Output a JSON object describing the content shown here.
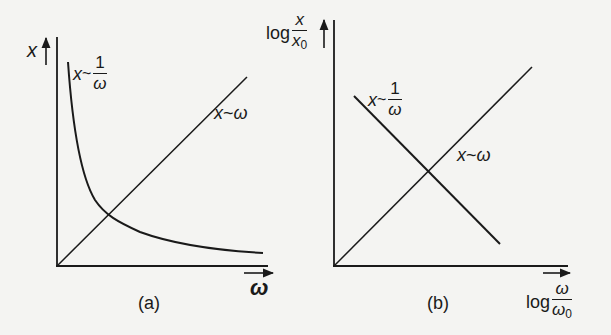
{
  "figure": {
    "panel_a": {
      "caption": "(a)",
      "y_axis_label": "x",
      "x_axis_label": "ω",
      "curve_inverse": {
        "lhs": "x",
        "rel": "~",
        "num": "1",
        "den": "ω"
      },
      "curve_linear": {
        "lhs": "x",
        "rel": "~",
        "rhs": "ω"
      },
      "scale": "linear"
    },
    "panel_b": {
      "caption": "(b)",
      "y_axis_label": {
        "prefix": "log",
        "num": "x",
        "den": "x",
        "den_sub": "0"
      },
      "x_axis_label": {
        "prefix": "log",
        "num": "ω",
        "den": "ω",
        "den_sub": "0"
      },
      "curve_inverse": {
        "lhs": "x",
        "rel": "~",
        "num": "1",
        "den": "ω"
      },
      "curve_linear": {
        "lhs": "x",
        "rel": "~",
        "rhs": "ω"
      },
      "scale": "log-log"
    },
    "colors": {
      "ink": "#1a1a1a",
      "paper": "#f4f4f2"
    }
  }
}
